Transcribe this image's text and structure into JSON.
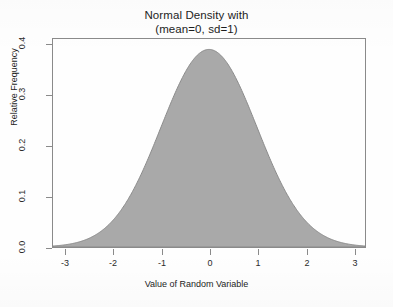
{
  "chart_data": {
    "type": "area",
    "title": "Normal Density with\n(mean=0, sd=1)",
    "title_line1": "Normal Density with",
    "title_line2": "(mean=0, sd=1)",
    "xlabel": "Value of Random Variable",
    "ylabel": "Relative Frequency",
    "xlim": [
      -3.25,
      3.25
    ],
    "ylim": [
      0,
      0.42
    ],
    "xticks": [
      -3,
      -2,
      -1,
      0,
      1,
      2,
      3
    ],
    "xtick_labels": [
      "-3",
      "-2",
      "-1",
      "0",
      "1",
      "2",
      "3"
    ],
    "yticks": [
      0.0,
      0.1,
      0.2,
      0.3,
      0.4
    ],
    "ytick_labels": [
      "0.0",
      "0.1",
      "0.2",
      "0.3",
      "0.4"
    ],
    "grid": false,
    "legend": null,
    "distribution": {
      "name": "normal",
      "mean": 0,
      "sd": 1,
      "peak_value": 0.3989
    },
    "fill_color": "#a9a9a9",
    "line_color": "#8a8a8a",
    "axis_color": "#8a8a8a",
    "background_color": "#fefefe",
    "x": [
      -3.25,
      -3.0,
      -2.75,
      -2.5,
      -2.25,
      -2.0,
      -1.75,
      -1.5,
      -1.25,
      -1.0,
      -0.75,
      -0.5,
      -0.25,
      0.0,
      0.25,
      0.5,
      0.75,
      1.0,
      1.25,
      1.5,
      1.75,
      2.0,
      2.25,
      2.5,
      2.75,
      3.0,
      3.25
    ],
    "values": [
      0.002,
      0.0044,
      0.0091,
      0.0175,
      0.0317,
      0.054,
      0.0863,
      0.1295,
      0.1826,
      0.242,
      0.3011,
      0.3521,
      0.3867,
      0.3989,
      0.3867,
      0.3521,
      0.3011,
      0.242,
      0.1826,
      0.1295,
      0.0863,
      0.054,
      0.0317,
      0.0175,
      0.0091,
      0.0044,
      0.002
    ]
  },
  "chart": {
    "title_line1": "Normal Density with",
    "title_line2": "(mean=0, sd=1)",
    "xlabel": "Value of Random Variable",
    "ylabel": "Relative Frequency",
    "ytick0": "0.0",
    "ytick1": "0.1",
    "ytick2": "0.2",
    "ytick3": "0.3",
    "ytick4": "0.4",
    "xtick0": "-3",
    "xtick1": "-2",
    "xtick2": "-1",
    "xtick3": "0",
    "xtick4": "1",
    "xtick5": "2",
    "xtick6": "3"
  }
}
